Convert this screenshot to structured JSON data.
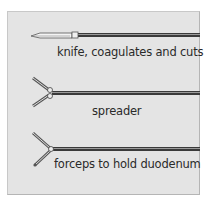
{
  "figure": {
    "instruments": [
      {
        "id": "knife",
        "label": "knife, coagulates and cuts"
      },
      {
        "id": "spreader",
        "label": "spreader"
      },
      {
        "id": "forceps",
        "label": "forceps to hold duodenum"
      }
    ],
    "colors": {
      "panel_bg": "#e4e4e4",
      "shaft": "#3a3a3a",
      "text": "#2a2a2a"
    }
  }
}
